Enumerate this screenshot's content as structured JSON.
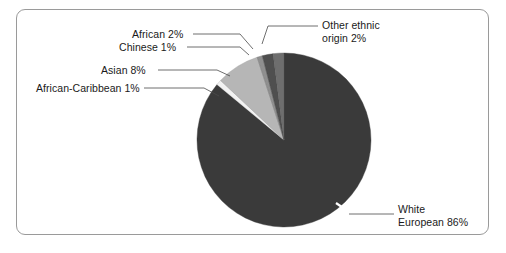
{
  "figure": {
    "border_color": "#9a9a9a",
    "background": "#ffffff"
  },
  "chart_data": {
    "type": "pie",
    "title": "",
    "xlabel": "",
    "ylabel": "",
    "legend_position": "none",
    "grid": false,
    "units": "percent",
    "total": 100,
    "start_angle_deg": 0,
    "direction": "clockwise",
    "categories": [
      "White European",
      "Other ethnic origin",
      "African",
      "Chinese",
      "Asian",
      "African-Caribbean"
    ],
    "values": [
      86,
      2,
      2,
      1,
      8,
      1
    ],
    "labels": [
      "White European 86%",
      "Other ethnic origin 2%",
      "African 2%",
      "Chinese 1%",
      "Asian 8%",
      "African-Caribbean 1%"
    ],
    "colors": [
      "#3a3a3a",
      "#6e6e6e",
      "#4f4f4f",
      "#8f8f8f",
      "#b6b6b6",
      "#f2f2f2"
    ],
    "slices": [
      {
        "name": "White European",
        "value": 86,
        "label": "White European 86%",
        "color": "#3a3a3a"
      },
      {
        "name": "Other ethnic origin",
        "value": 2,
        "label": "Other ethnic origin 2%",
        "color": "#6e6e6e"
      },
      {
        "name": "African",
        "value": 2,
        "label": "African 2%",
        "color": "#4f4f4f"
      },
      {
        "name": "Chinese",
        "value": 1,
        "label": "Chinese 1%",
        "color": "#8f8f8f"
      },
      {
        "name": "Asian",
        "value": 8,
        "label": "Asian 8%",
        "color": "#b6b6b6"
      },
      {
        "name": "African-Caribbean",
        "value": 1,
        "label": "African-Caribbean 1%",
        "color": "#f2f2f2"
      }
    ]
  },
  "callouts": {
    "african_caribbean": "African-Caribbean 1%",
    "asian": "Asian 8%",
    "chinese": "Chinese 1%",
    "african": "African 2%",
    "other_ethnic_line1": "Other ethnic",
    "other_ethnic_line2": "origin 2%",
    "white_line1": "White",
    "white_line2": "European 86%"
  }
}
